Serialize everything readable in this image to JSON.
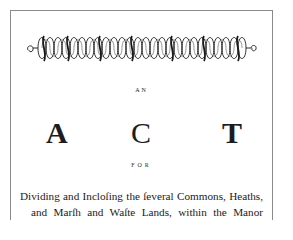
{
  "document": {
    "ornament": {
      "icon": "interlaced-loop-border-ornament",
      "color": "#1a1a1a"
    },
    "heading_small": "AN",
    "title_letters": [
      "A",
      "C",
      "T"
    ],
    "subheading": "FOR",
    "body_lines": [
      "Dividing and Incloſing the ſeveral Commons, Heaths,",
      "and Marſh and Waſte Lands, within the Manor"
    ],
    "frame_color": "#8a8a8a"
  }
}
